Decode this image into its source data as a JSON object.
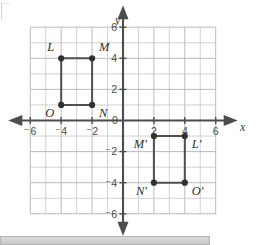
{
  "figure": {
    "axis_labels": {
      "x": "x",
      "y": "y"
    },
    "x_ticks": [
      {
        "value": -6,
        "label": "⁻6"
      },
      {
        "value": -4,
        "label": "⁻4"
      },
      {
        "value": -2,
        "label": "⁻2"
      },
      {
        "value": 2,
        "label": "2"
      },
      {
        "value": 4,
        "label": "4"
      },
      {
        "value": 6,
        "label": "6"
      }
    ],
    "y_ticks": [
      {
        "value": 6,
        "label": "6"
      },
      {
        "value": 4,
        "label": "4"
      },
      {
        "value": 2,
        "label": "2"
      },
      {
        "value": -2,
        "label": "⁻2"
      },
      {
        "value": -4,
        "label": "⁻4"
      },
      {
        "value": -6,
        "label": "⁻6"
      }
    ],
    "origin_label": "0",
    "grid": {
      "xmin": -6,
      "xmax": 6,
      "ymin": -6,
      "ymax": 6,
      "step": 1,
      "visible": true
    },
    "colors": {
      "grid": "#c6c6c6",
      "axis": "#4d4d4d",
      "shape": "#4f4f4f",
      "vertex": "#303030",
      "tick_text": "#4a4a4a",
      "label_text": "#2e2e2e",
      "bottom_bar": "#d2d2d2"
    }
  },
  "chart_data": {
    "type": "scatter",
    "title": "",
    "xlabel": "x",
    "ylabel": "y",
    "xlim": [
      -6,
      6
    ],
    "ylim": [
      -6,
      6
    ],
    "grid": true,
    "legend": "none",
    "series": [
      {
        "name": "LMNO",
        "closed": true,
        "points": [
          {
            "label": "L",
            "x": -4,
            "y": 4,
            "label_pos": "above-left"
          },
          {
            "label": "M",
            "x": -2,
            "y": 4,
            "label_pos": "above-right"
          },
          {
            "label": "N",
            "x": -2,
            "y": 1,
            "label_pos": "below-right"
          },
          {
            "label": "O",
            "x": -4,
            "y": 1,
            "label_pos": "below-left"
          }
        ]
      },
      {
        "name": "M'L'O'N'",
        "closed": true,
        "points": [
          {
            "label": "M'",
            "x": 2,
            "y": -1,
            "label_pos": "below-left"
          },
          {
            "label": "L'",
            "x": 4,
            "y": -1,
            "label_pos": "below-right"
          },
          {
            "label": "O'",
            "x": 4,
            "y": -4,
            "label_pos": "below-right"
          },
          {
            "label": "N'",
            "x": 2,
            "y": -4,
            "label_pos": "below-left"
          }
        ]
      }
    ]
  }
}
